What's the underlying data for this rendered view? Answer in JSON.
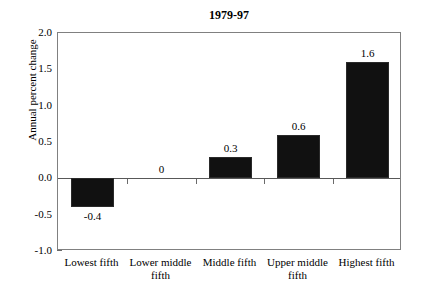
{
  "chart_data": {
    "type": "bar",
    "title": "1979-97",
    "xlabel": "",
    "ylabel": "Annual percent change",
    "categories": [
      "Lowest fifth",
      "Lower middle fifth",
      "Middle fifth",
      "Upper middle fifth",
      "Highest fifth"
    ],
    "category_lines": [
      [
        "Lowest fifth"
      ],
      [
        "Lower middle",
        "fifth"
      ],
      [
        "Middle fifth"
      ],
      [
        "Upper middle",
        "fifth"
      ],
      [
        "Highest fifth"
      ]
    ],
    "values": [
      -0.4,
      0,
      0.3,
      0.6,
      1.6
    ],
    "value_labels": [
      "-0.4",
      "0",
      "0.3",
      "0.6",
      "1.6"
    ],
    "ylim": [
      -1.0,
      2.0
    ],
    "ytick_labels": [
      "2.0",
      "1.5",
      "1.0",
      "0.5",
      "0.0",
      "-0.5",
      "-1.0"
    ],
    "ytick_values": [
      2.0,
      1.5,
      1.0,
      0.5,
      0.0,
      -0.5,
      -1.0
    ],
    "grid": false,
    "legend": false,
    "bar_color": "#111111",
    "axis_color": "#808080",
    "background_color": "#ffffff"
  }
}
